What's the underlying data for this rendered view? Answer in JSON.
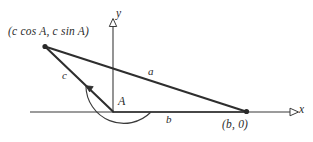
{
  "figure": {
    "type": "geometry-diagram",
    "background_color": "#ffffff",
    "line_color": "#333333",
    "text_color": "#2b2b2b"
  },
  "axes": {
    "x_label": "x",
    "y_label": "y",
    "origin": {
      "x": 113,
      "y": 112
    },
    "x_axis": {
      "start_x": 30,
      "end_x": 297,
      "y": 112,
      "arrow": "open-triangle-right"
    },
    "y_axis": {
      "x": 113,
      "start_y": 112,
      "end_y": 20,
      "arrow": "open-triangle-up"
    }
  },
  "points": [
    {
      "name": "vertex-upper-left",
      "label": "(c cos A, c sin A)",
      "x": 44,
      "y": 46,
      "marker": "filled-dot"
    },
    {
      "name": "vertex-right",
      "label": "(b, 0)",
      "x": 247,
      "y": 112,
      "marker": "filled-dot"
    },
    {
      "name": "vertex-origin",
      "label": "",
      "x": 113,
      "y": 112,
      "marker": "none"
    }
  ],
  "sides": [
    {
      "name": "side-a",
      "label": "a",
      "from": "vertex-upper-left",
      "to": "vertex-right",
      "label_position": "above"
    },
    {
      "name": "side-b",
      "label": "b",
      "from": "vertex-origin",
      "to": "vertex-right",
      "label_position": "below"
    },
    {
      "name": "side-c",
      "label": "c",
      "from": "vertex-origin",
      "to": "vertex-upper-left",
      "label_position": "left"
    }
  ],
  "angle": {
    "name": "angle-A",
    "label": "A",
    "at": "vertex-origin",
    "from_ray": "positive-x-axis",
    "to_ray": "side-c",
    "sweep": "counterclockwise",
    "arc_radius": 38,
    "arrow": "at-end-on-side-c"
  }
}
